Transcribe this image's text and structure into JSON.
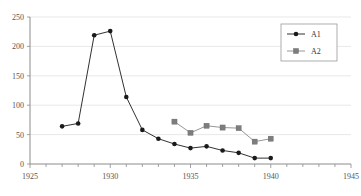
{
  "chart_data": {
    "type": "line",
    "title": "",
    "subtitle": "",
    "xlabel": "",
    "ylabel": "",
    "xlim": [
      1925,
      1945
    ],
    "ylim": [
      0,
      250
    ],
    "grid": true,
    "grid_axis": "y",
    "legend_position": "top-right",
    "x_tick_labels": [
      "1925",
      "1930",
      "1935",
      "1940",
      "1945"
    ],
    "x_tick_values": [
      1925,
      1930,
      1935,
      1940,
      1945
    ],
    "x_minor_ticks": [
      1926,
      1927,
      1928,
      1929,
      1931,
      1932,
      1933,
      1934,
      1936,
      1937,
      1938,
      1939,
      1941,
      1942,
      1943,
      1944
    ],
    "y_tick_labels": [
      "0",
      "50",
      "100",
      "150",
      "200",
      "250"
    ],
    "y_tick_values": [
      0,
      50,
      100,
      150,
      200,
      250
    ],
    "series": [
      {
        "name": "A1",
        "marker": "circle",
        "color": "#1a1a1a",
        "x": [
          1927,
          1928,
          1929,
          1930,
          1931,
          1932,
          1933,
          1934,
          1935,
          1936,
          1937,
          1938,
          1939,
          1940
        ],
        "values": [
          64,
          69,
          219,
          226,
          114,
          58,
          43,
          34,
          27,
          30,
          23,
          19,
          10,
          10
        ]
      },
      {
        "name": "A2",
        "marker": "square",
        "color": "#7d7d7d",
        "x": [
          1934,
          1935,
          1936,
          1937,
          1938,
          1939,
          1940
        ],
        "values": [
          72,
          53,
          65,
          62,
          61,
          38,
          43
        ]
      }
    ]
  },
  "legend": {
    "entries": [
      {
        "label": "A1"
      },
      {
        "label": "A2"
      }
    ]
  }
}
